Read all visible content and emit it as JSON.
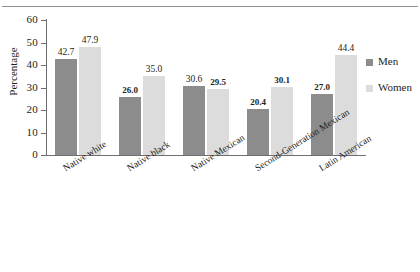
{
  "chart_data": {
    "type": "bar",
    "title": "",
    "xlabel": "",
    "ylabel": "Percentage",
    "ylim": [
      0,
      60
    ],
    "yticks": [
      0,
      10,
      20,
      30,
      40,
      50,
      60
    ],
    "ytick_labels": [
      "0",
      "10",
      "20",
      "30",
      "40",
      "50",
      "60"
    ],
    "grid": false,
    "legend_position": "right",
    "categories": [
      "Native white",
      "Native black",
      "Native Mexican",
      "Second-Generation Mexican",
      "Latin American"
    ],
    "series": [
      {
        "name": "Men",
        "color": "#8c8c8c",
        "values": [
          42.7,
          26.0,
          30.6,
          20.4,
          27.0
        ],
        "labels": [
          "42.7",
          "26.0",
          "30.6",
          "20.4",
          "27.0"
        ],
        "label_bold": [
          false,
          true,
          false,
          true,
          true
        ]
      },
      {
        "name": "Women",
        "color": "#dcdcdc",
        "values": [
          47.9,
          35.0,
          29.5,
          30.1,
          44.4
        ],
        "labels": [
          "47.9",
          "35.0",
          "29.5",
          "30.1",
          "44.4"
        ],
        "label_bold": [
          false,
          false,
          true,
          true,
          false
        ]
      }
    ]
  },
  "legend": {
    "items": [
      {
        "label": "Men",
        "color": "#8c8c8c"
      },
      {
        "label": "Women",
        "color": "#dcdcdc"
      }
    ]
  }
}
